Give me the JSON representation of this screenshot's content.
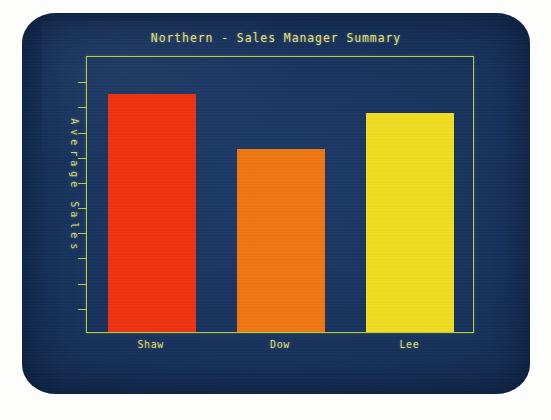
{
  "display": {
    "device": "crt-monitor",
    "screen_bg_color": "#17325b",
    "photo_bg_color": "#fdfdfb"
  },
  "chart_data": {
    "type": "bar",
    "title": "Northern - Sales Manager Summary",
    "xlabel": "",
    "ylabel": "Average Sales",
    "categories": [
      "Shaw",
      "Dow",
      "Lee"
    ],
    "values": [
      86,
      66,
      79
    ],
    "ylim": [
      0,
      100
    ],
    "grid": false,
    "legend": false,
    "y_tick_count": 10,
    "y_tick_labels": [],
    "bar_colors": [
      "#ee3311",
      "#ee7711",
      "#f0dd22"
    ],
    "axis_color": "#b9ce3e",
    "text_color": "#dcd97e",
    "series": [
      {
        "name": "Average Sales",
        "points": [
          {
            "category": "Shaw",
            "value": 86,
            "color": "#ee3311"
          },
          {
            "category": "Dow",
            "value": 66,
            "color": "#ee7711"
          },
          {
            "category": "Lee",
            "value": 79,
            "color": "#f0dd22"
          }
        ]
      }
    ]
  },
  "ylabel_chars": [
    "A",
    "v",
    "e",
    "r",
    "a",
    "g",
    "e",
    " ",
    "S",
    "a",
    "l",
    "e",
    "s"
  ]
}
